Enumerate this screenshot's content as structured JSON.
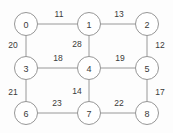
{
  "figure": {
    "name": "weighted-undirected-graph",
    "width": 173,
    "height": 133,
    "background_color": "#fdfdfd",
    "node_fill_color": "#ffffff",
    "node_stroke_color": "#8a8a8a",
    "edge_stroke_color": "#8c8c8c",
    "label_color": "#3a3a3a",
    "node_radius": 11.5
  },
  "chart_data": {
    "type": "diagram",
    "title": "",
    "xlabel": "",
    "ylabel": "",
    "graph_type": "undirected-weighted-grid-graph",
    "node_count": 9,
    "edge_count": 12,
    "nodes": [
      {
        "id": "0",
        "label": "0",
        "x": 26,
        "y": 24,
        "row": 0,
        "col": 0
      },
      {
        "id": "1",
        "label": "1",
        "x": 89,
        "y": 24,
        "row": 0,
        "col": 1
      },
      {
        "id": "2",
        "label": "2",
        "x": 147,
        "y": 24,
        "row": 0,
        "col": 2
      },
      {
        "id": "3",
        "label": "3",
        "x": 26,
        "y": 68,
        "row": 1,
        "col": 0
      },
      {
        "id": "4",
        "label": "4",
        "x": 89,
        "y": 68,
        "row": 1,
        "col": 1
      },
      {
        "id": "5",
        "label": "5",
        "x": 147,
        "y": 68,
        "row": 1,
        "col": 2
      },
      {
        "id": "6",
        "label": "6",
        "x": 26,
        "y": 113,
        "row": 2,
        "col": 0
      },
      {
        "id": "7",
        "label": "7",
        "x": 89,
        "y": 113,
        "row": 2,
        "col": 1
      },
      {
        "id": "8",
        "label": "8",
        "x": 147,
        "y": 113,
        "row": 2,
        "col": 2
      }
    ],
    "edges": [
      {
        "id": "0-1",
        "source": "0",
        "target": "1",
        "weight": "11",
        "label_x": 59,
        "label_y": 14,
        "orientation": "horizontal"
      },
      {
        "id": "1-2",
        "source": "1",
        "target": "2",
        "weight": "13",
        "label_x": 119,
        "label_y": 14,
        "orientation": "horizontal"
      },
      {
        "id": "0-3",
        "source": "0",
        "target": "3",
        "weight": "20",
        "label_x": 13,
        "label_y": 45,
        "orientation": "vertical"
      },
      {
        "id": "1-4",
        "source": "1",
        "target": "4",
        "weight": "28",
        "label_x": 77,
        "label_y": 44,
        "orientation": "vertical"
      },
      {
        "id": "2-5",
        "source": "2",
        "target": "5",
        "weight": "12",
        "label_x": 160,
        "label_y": 45,
        "orientation": "vertical"
      },
      {
        "id": "3-4",
        "source": "3",
        "target": "4",
        "weight": "18",
        "label_x": 58,
        "label_y": 58,
        "orientation": "horizontal"
      },
      {
        "id": "4-5",
        "source": "4",
        "target": "5",
        "weight": "19",
        "label_x": 120,
        "label_y": 58,
        "orientation": "horizontal"
      },
      {
        "id": "3-6",
        "source": "3",
        "target": "6",
        "weight": "21",
        "label_x": 13,
        "label_y": 92,
        "orientation": "vertical"
      },
      {
        "id": "4-7",
        "source": "4",
        "target": "7",
        "weight": "14",
        "label_x": 77,
        "label_y": 91,
        "orientation": "vertical"
      },
      {
        "id": "5-8",
        "source": "5",
        "target": "8",
        "weight": "17",
        "label_x": 160,
        "label_y": 92,
        "orientation": "vertical"
      },
      {
        "id": "6-7",
        "source": "6",
        "target": "7",
        "weight": "23",
        "label_x": 57,
        "label_y": 103,
        "orientation": "horizontal"
      },
      {
        "id": "7-8",
        "source": "7",
        "target": "8",
        "weight": "22",
        "label_x": 119,
        "label_y": 103,
        "orientation": "horizontal"
      }
    ]
  }
}
